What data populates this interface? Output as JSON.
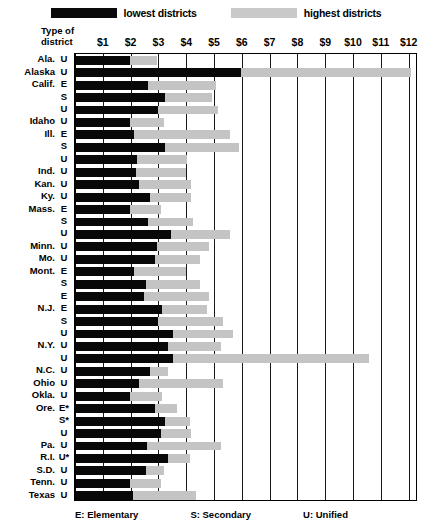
{
  "legend": {
    "low": {
      "label": "lowest districts",
      "color": "#0a0a0a",
      "icon": "legend-swatch"
    },
    "high": {
      "label": "highest districts",
      "color": "#c9c9c9",
      "icon": "legend-swatch"
    }
  },
  "header": {
    "type_of_district_line1": "Type of",
    "type_of_district_line2": "district"
  },
  "footnote": {
    "elementary": "E: Elementary",
    "secondary": "S: Secondary",
    "unified": "U: Unified"
  },
  "chart_data": {
    "type": "bar",
    "orientation": "horizontal",
    "title": "",
    "xlabel": "",
    "ylabel": "",
    "xlim": [
      0,
      12.3
    ],
    "grid": true,
    "legend_position": "top-center",
    "tick_labels": [
      "$1",
      "$2",
      "$3",
      "$4",
      "$5",
      "$6",
      "$7",
      "$8",
      "$9",
      "$10",
      "$11",
      "$12"
    ],
    "ticks": [
      1,
      2,
      3,
      4,
      5,
      6,
      7,
      8,
      9,
      10,
      11,
      12
    ],
    "series": [
      {
        "name": "lowest districts",
        "color": "#080808"
      },
      {
        "name": "highest districts",
        "color": "#c4c4c4"
      }
    ],
    "rows": [
      {
        "state": "Ala.",
        "type": "U",
        "low": 1.95,
        "high": 2.9
      },
      {
        "state": "Alaska",
        "type": "U",
        "low": 5.95,
        "high": 12.05
      },
      {
        "state": "Calif.",
        "type": "E",
        "low": 2.6,
        "high": 5.05
      },
      {
        "state": "",
        "type": "S",
        "low": 3.2,
        "high": 4.9
      },
      {
        "state": "",
        "type": "U",
        "low": 2.95,
        "high": 5.1
      },
      {
        "state": "Idaho",
        "type": "U",
        "low": 1.95,
        "high": 3.15
      },
      {
        "state": "Ill.",
        "type": "E",
        "low": 2.1,
        "high": 5.55
      },
      {
        "state": "",
        "type": "S",
        "low": 3.2,
        "high": 5.85
      },
      {
        "state": "",
        "type": "U",
        "low": 2.2,
        "high": 4.0
      },
      {
        "state": "Ind.",
        "type": "U",
        "low": 2.15,
        "high": 3.95
      },
      {
        "state": "Kan.",
        "type": "U",
        "low": 2.25,
        "high": 4.15
      },
      {
        "state": "Ky.",
        "type": "U",
        "low": 2.65,
        "high": 4.15
      },
      {
        "state": "Mass.",
        "type": "E",
        "low": 1.95,
        "high": 3.05
      },
      {
        "state": "",
        "type": "S",
        "low": 2.6,
        "high": 4.2
      },
      {
        "state": "",
        "type": "U",
        "low": 3.4,
        "high": 5.55
      },
      {
        "state": "Minn.",
        "type": "U",
        "low": 2.9,
        "high": 4.8
      },
      {
        "state": "Mo.",
        "type": "U",
        "low": 2.85,
        "high": 4.45
      },
      {
        "state": "Mont.",
        "type": "E",
        "low": 2.1,
        "high": 3.95
      },
      {
        "state": "",
        "type": "S",
        "low": 2.5,
        "high": 4.45
      },
      {
        "state": "",
        "type": "E",
        "low": 2.45,
        "high": 4.8
      },
      {
        "state": "N.J.",
        "type": "E",
        "low": 3.1,
        "high": 4.7
      },
      {
        "state": "",
        "type": "S",
        "low": 2.95,
        "high": 5.3
      },
      {
        "state": "",
        "type": "U",
        "low": 3.5,
        "high": 5.65
      },
      {
        "state": "N.Y.",
        "type": "U",
        "low": 3.3,
        "high": 5.2
      },
      {
        "state": "",
        "type": "U",
        "low": 3.5,
        "high": 10.55
      },
      {
        "state": "N.C.",
        "type": "U",
        "low": 2.65,
        "high": 3.3
      },
      {
        "state": "Ohio",
        "type": "U",
        "low": 2.25,
        "high": 5.3
      },
      {
        "state": "Okla.",
        "type": "U",
        "low": 1.95,
        "high": 3.1
      },
      {
        "state": "Ore.",
        "type": "E*",
        "low": 2.85,
        "high": 3.65
      },
      {
        "state": "",
        "type": "S*",
        "low": 3.2,
        "high": 4.1
      },
      {
        "state": "",
        "type": "U",
        "low": 3.05,
        "high": 4.15
      },
      {
        "state": "Pa.",
        "type": "U",
        "low": 2.55,
        "high": 5.2
      },
      {
        "state": "R.I.",
        "type": "U*",
        "low": 3.3,
        "high": 4.1
      },
      {
        "state": "S.D.",
        "type": "U",
        "low": 2.5,
        "high": 3.15
      },
      {
        "state": "Tenn.",
        "type": "U",
        "low": 1.95,
        "high": 3.05
      },
      {
        "state": "Texas",
        "type": "U",
        "low": 2.05,
        "high": 4.3
      }
    ]
  }
}
